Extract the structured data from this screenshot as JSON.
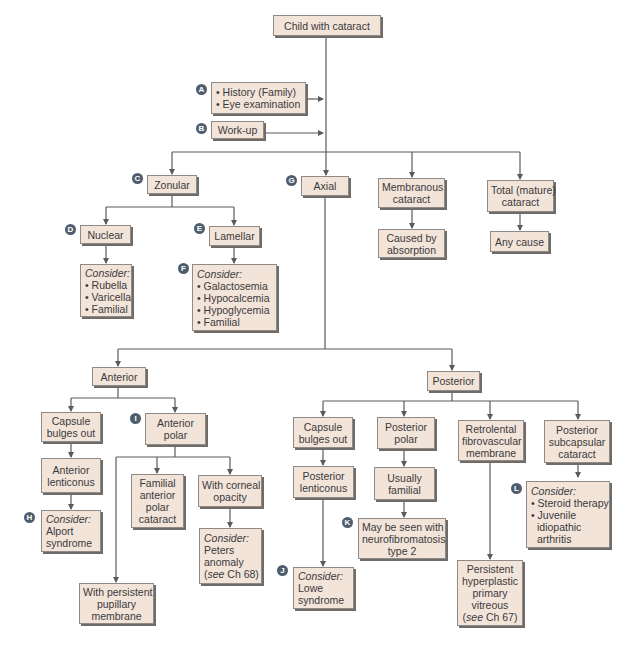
{
  "colors": {
    "box_fill": "#f3e4da",
    "box_border": "#8f8a86",
    "box_shadow": "#6f6b68",
    "connector": "#5a5a5a",
    "label_circle": "#4e5d6e",
    "label_text": "#ffffff"
  },
  "root": {
    "label": "Child with cataract"
  },
  "steps": {
    "a": {
      "marker": "A",
      "lines": [
        "• History (Family)",
        "• Eye examination"
      ]
    },
    "b": {
      "marker": "B",
      "label": "Work-up"
    }
  },
  "level1": {
    "zonular": {
      "marker": "C",
      "label": "Zonular"
    },
    "axial": {
      "marker": "G",
      "label": "Axial"
    },
    "membranous": {
      "lines": [
        "Membranous",
        "cataract"
      ]
    },
    "membranous_cause": {
      "lines": [
        "Caused by",
        "absorption"
      ]
    },
    "total": {
      "lines": [
        "Total (mature)",
        "cataract"
      ]
    },
    "total_cause": {
      "label": "Any cause"
    }
  },
  "zonular_branch": {
    "nuclear": {
      "marker": "D",
      "label": "Nuclear"
    },
    "nuclear_consider": {
      "title": "Consider:",
      "items": [
        "• Rubella",
        "• Varicella",
        "• Familial"
      ]
    },
    "lamellar": {
      "marker": "E",
      "label": "Lamellar"
    },
    "lamellar_consider": {
      "marker": "F",
      "title": "Consider:",
      "items": [
        "• Galactosemia",
        "• Hypocalcemia",
        "• Hypoglycemia",
        "• Familial"
      ]
    }
  },
  "anterior_branch": {
    "anterior": {
      "label": "Anterior"
    },
    "capsule": {
      "lines": [
        "Capsule",
        "bulges out"
      ]
    },
    "lenticonus": {
      "lines": [
        "Anterior",
        "lenticonus"
      ]
    },
    "lenticonus_consider": {
      "marker": "H",
      "title": "Consider:",
      "lines": [
        "Alport",
        "syndrome"
      ]
    },
    "polar": {
      "marker": "I",
      "lines": [
        "Anterior",
        "polar"
      ]
    },
    "familial": {
      "lines": [
        "Familial",
        "anterior",
        "polar",
        "cataract"
      ]
    },
    "corneal": {
      "lines": [
        "With corneal",
        "opacity"
      ]
    },
    "corneal_consider": {
      "title": "Consider:",
      "lines": [
        "Peters",
        "anomaly"
      ],
      "ref_italic": "see",
      "ref_rest": " Ch 68)",
      "ref_open": "("
    },
    "pupillary": {
      "lines": [
        "With persistent",
        "pupillary",
        "membrane"
      ]
    }
  },
  "posterior_branch": {
    "posterior": {
      "label": "Posterior"
    },
    "capsule": {
      "lines": [
        "Capsule",
        "bulges out"
      ]
    },
    "lenticonus": {
      "lines": [
        "Posterior",
        "lenticonus"
      ]
    },
    "lenticonus_consider": {
      "marker": "J",
      "title": "Consider:",
      "lines": [
        "Lowe",
        "syndrome"
      ]
    },
    "polar": {
      "lines": [
        "Posterior",
        "polar"
      ]
    },
    "familial": {
      "lines": [
        "Usually",
        "familial"
      ]
    },
    "nf2": {
      "marker": "K",
      "lines": [
        "May be seen with",
        "neurofibromatosis",
        "type 2"
      ]
    },
    "retrolental": {
      "lines": [
        "Retrolental",
        "fibrovascular",
        "membrane"
      ]
    },
    "phpv": {
      "lines": [
        "Persistent",
        "hyperplastic",
        "primary",
        "vitreous"
      ],
      "ref_open": "(",
      "ref_italic": "see",
      "ref_rest": " Ch 67)"
    },
    "subcapsular": {
      "lines": [
        "Posterior",
        "subcapsular",
        "cataract"
      ]
    },
    "subcapsular_consider": {
      "marker": "L",
      "title": "Consider:",
      "items": [
        "• Steroid therapy",
        "• Juvenile"
      ],
      "continued": [
        "idiopathic",
        "arthritis"
      ]
    }
  }
}
